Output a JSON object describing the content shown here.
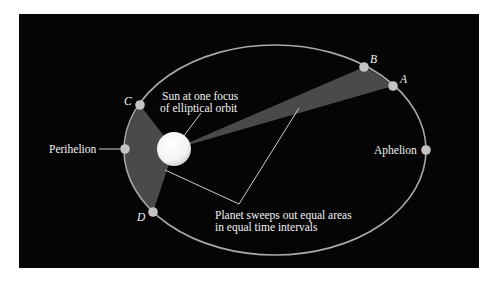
{
  "diagram": {
    "colors": {
      "background": "#050505",
      "orbit": "#a9a9a9",
      "swept_area": "#4a4a4a",
      "planet": "#c4c4c4",
      "sun": "#f6f6f6",
      "text": "#f2f2f2"
    },
    "points": {
      "A": "A",
      "B": "B",
      "C": "C",
      "D": "D"
    },
    "labels": {
      "perihelion": "Perihelion",
      "aphelion": "Aphelion",
      "sun_line1": "Sun at one focus",
      "sun_line2": "of elliptical orbit",
      "area_line1": "Planet sweeps out equal areas",
      "area_line2": "in equal time intervals"
    }
  }
}
